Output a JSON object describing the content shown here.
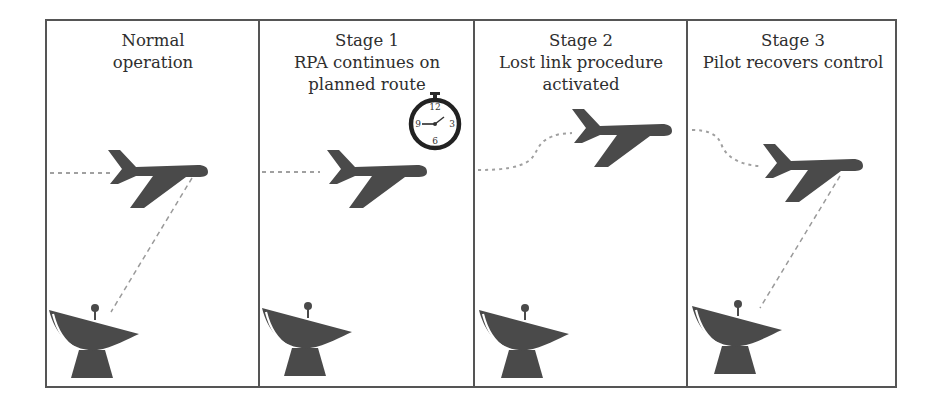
{
  "figure": {
    "colors": {
      "icon": "#4a4a4a",
      "border": "#555555",
      "link": "#9a9a9a",
      "background": "#ffffff"
    },
    "panels": [
      {
        "id": "normal",
        "title_line1": "Normal",
        "title_line2": "operation",
        "title_line3": "",
        "link_active": true,
        "icons": [
          "airplane-icon",
          "satellite-dish-icon"
        ]
      },
      {
        "id": "stage1",
        "title_line1": "Stage 1",
        "title_line2": "RPA continues on",
        "title_line3": "planned route",
        "link_active": false,
        "icons": [
          "airplane-icon",
          "stopwatch-icon",
          "satellite-dish-icon"
        ],
        "stopwatch": {
          "labels": [
            "12",
            "3",
            "6",
            "9"
          ]
        }
      },
      {
        "id": "stage2",
        "title_line1": "Stage 2",
        "title_line2": "Lost link procedure",
        "title_line3": "activated",
        "link_active": false,
        "icons": [
          "airplane-icon",
          "satellite-dish-icon"
        ]
      },
      {
        "id": "stage3",
        "title_line1": "Stage 3",
        "title_line2": "Pilot recovers control",
        "title_line3": "",
        "link_active": true,
        "icons": [
          "airplane-icon",
          "satellite-dish-icon"
        ]
      }
    ]
  }
}
